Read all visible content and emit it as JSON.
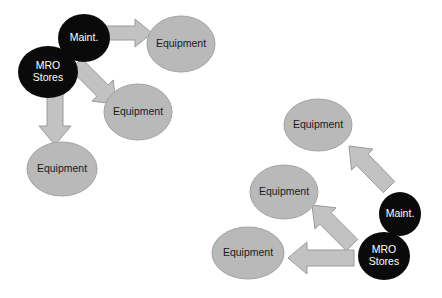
{
  "diagram": {
    "background_color": "#ffffff",
    "dark_node_fill": "#0a0a0a",
    "dark_node_text_color": "#ffffff",
    "light_node_fill": "#b9b9b9",
    "light_node_stroke": "#a2a2a2",
    "light_node_text_color": "#1a1a1a",
    "arrow_fill": "#c2c2c2",
    "arrow_stroke": "#9a9a9a",
    "clusters": [
      {
        "id": "left-cluster",
        "name": "push-distribution-cluster",
        "nodes": [
          {
            "id": "left-mro-stores",
            "name": "mro-stores-node-left",
            "label_lines": [
              "MRO",
              "Stores"
            ],
            "style": "dark",
            "cx": 48,
            "cy": 72,
            "rx": 30,
            "ry": 26
          },
          {
            "id": "left-maint",
            "name": "maintenance-node-left",
            "label_lines": [
              "Maint."
            ],
            "style": "dark",
            "cx": 84,
            "cy": 38,
            "rx": 26,
            "ry": 24
          },
          {
            "id": "left-equipment-top",
            "name": "equipment-node-left-top",
            "label_lines": [
              "Equipment"
            ],
            "style": "light",
            "cx": 181,
            "cy": 44,
            "rx": 34,
            "ry": 28
          },
          {
            "id": "left-equipment-mid",
            "name": "equipment-node-left-middle",
            "label_lines": [
              "Equipment"
            ],
            "style": "light",
            "cx": 138,
            "cy": 112,
            "rx": 34,
            "ry": 28
          },
          {
            "id": "left-equipment-bottom",
            "name": "equipment-node-left-bottom",
            "label_lines": [
              "Equipment"
            ],
            "style": "light",
            "cx": 62,
            "cy": 169,
            "rx": 35,
            "ry": 27
          }
        ],
        "arrows": [
          {
            "id": "left-arrow-maint-to-equipment-top",
            "name": "arrow-maintenance-to-equipment-top",
            "from": "left-maint",
            "to": "left-equipment-top",
            "direction": "right",
            "x1": 104,
            "y1": 33,
            "x2": 152,
            "y2": 33,
            "shaft_half_width": 7,
            "head_half_width": 14,
            "head_length": 17
          },
          {
            "id": "left-arrow-to-equipment-mid",
            "name": "arrow-stores-to-equipment-middle",
            "from": "left-mro-stores",
            "to": "left-equipment-mid",
            "direction": "down-right",
            "x1": 76,
            "y1": 64,
            "x2": 116,
            "y2": 104,
            "shaft_half_width": 8,
            "head_half_width": 15,
            "head_length": 19
          },
          {
            "id": "left-arrow-to-equipment-bottom",
            "name": "arrow-stores-to-equipment-bottom",
            "from": "left-mro-stores",
            "to": "left-equipment-bottom",
            "direction": "down",
            "x1": 55,
            "y1": 90,
            "x2": 55,
            "y2": 145,
            "shaft_half_width": 8,
            "head_half_width": 16,
            "head_length": 19
          }
        ]
      },
      {
        "id": "right-cluster",
        "name": "pull-replenishment-cluster",
        "nodes": [
          {
            "id": "right-equipment-top",
            "name": "equipment-node-right-top",
            "label_lines": [
              "Equipment"
            ],
            "style": "light",
            "cx": 318,
            "cy": 125,
            "rx": 34,
            "ry": 26
          },
          {
            "id": "right-equipment-mid",
            "name": "equipment-node-right-middle",
            "label_lines": [
              "Equipment"
            ],
            "style": "light",
            "cx": 284,
            "cy": 192,
            "rx": 34,
            "ry": 27
          },
          {
            "id": "right-equipment-bottom",
            "name": "equipment-node-right-bottom",
            "label_lines": [
              "Equipment"
            ],
            "style": "light",
            "cx": 248,
            "cy": 253,
            "rx": 36,
            "ry": 26
          },
          {
            "id": "right-maint",
            "name": "maintenance-node-right",
            "label_lines": [
              "Maint."
            ],
            "style": "dark",
            "cx": 400,
            "cy": 214,
            "rx": 21,
            "ry": 22
          },
          {
            "id": "right-mro-stores",
            "name": "mro-stores-node-right",
            "label_lines": [
              "MRO",
              "Stores"
            ],
            "style": "dark",
            "cx": 384,
            "cy": 256,
            "rx": 26,
            "ry": 24
          }
        ],
        "arrows": [
          {
            "id": "right-arrow-maint-to-equipment-top",
            "name": "arrow-maintenance-to-equipment-top-right",
            "from": "right-maint",
            "to": "right-equipment-top",
            "direction": "up-left",
            "x1": 389,
            "y1": 187,
            "x2": 349,
            "y2": 146,
            "shaft_half_width": 8,
            "head_half_width": 15,
            "head_length": 19
          },
          {
            "id": "right-arrow-stores-to-equipment-mid",
            "name": "arrow-stores-to-equipment-middle-right",
            "from": "right-mro-stores",
            "to": "right-equipment-mid",
            "direction": "up-left",
            "x1": 352,
            "y1": 245,
            "x2": 312,
            "y2": 205,
            "shaft_half_width": 8,
            "head_half_width": 15,
            "head_length": 19
          },
          {
            "id": "right-arrow-stores-to-equipment-bottom",
            "name": "arrow-stores-to-equipment-bottom-right",
            "from": "right-mro-stores",
            "to": "right-equipment-bottom",
            "direction": "left",
            "x1": 354,
            "y1": 258,
            "x2": 288,
            "y2": 258,
            "shaft_half_width": 8,
            "head_half_width": 16,
            "head_length": 19
          }
        ]
      }
    ]
  }
}
